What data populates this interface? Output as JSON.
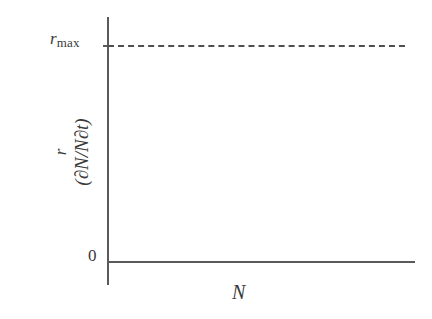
{
  "figure": {
    "name": "density-independent-population-growth-figure",
    "background_color": "#ffffff",
    "line_color": "#5a5a5a",
    "text_color": "#3a3a3a"
  },
  "axes": {
    "y_label_symbol": "r",
    "y_label_expression": "(∂N/N∂t)",
    "y_tick_top": "r",
    "y_tick_top_subscript": "max",
    "y_tick_zero": "0",
    "x_label": "N"
  },
  "chart_data": {
    "type": "line",
    "title": "",
    "xlabel": "N",
    "ylabel": "r (∂N/N∂t)",
    "xlim": [
      0,
      1
    ],
    "ylim": [
      0,
      1
    ],
    "grid": false,
    "legend": "none",
    "x_tick_labels": [],
    "y_tick_labels": [
      "0",
      "r_max"
    ],
    "y_tick_values": [
      0,
      1
    ],
    "series": [
      {
        "name": "r_max",
        "style": "dashed",
        "color": "#4f4f4f",
        "x": [
          0,
          1
        ],
        "values": [
          1,
          1
        ],
        "description": "Constant per-capita growth rate at r_max, independent of population size N"
      }
    ],
    "annotations": [
      {
        "text": "r_max",
        "x": 0,
        "y": 1,
        "position": "left-of-axis"
      },
      {
        "text": "0",
        "x": 0,
        "y": 0,
        "position": "left-of-axis"
      }
    ]
  }
}
